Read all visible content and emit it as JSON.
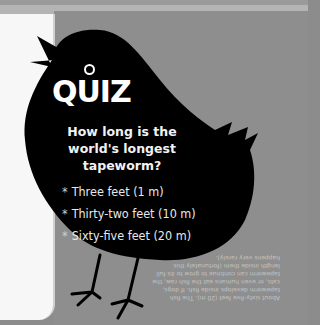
{
  "quiz": {
    "title": "QUIZ",
    "question": "How long is the world's longest tapeworm?",
    "options": [
      "Three feet (1 m)",
      "Thirty-two feet (10 m)",
      "Sixty-five feet (20 m)"
    ],
    "bullet_glyph": "*",
    "answer_upside_down": "About sixty-five feet (20 m). The fish tapeworm develops inside fish. If dogs, cats, or even humans eat the fish raw, the tapeworm can continue to grow to its full length inside them (fortunately this happens very rarely)."
  },
  "colors": {
    "background": "#8e8e8e",
    "bird": "#000000",
    "left_page": "#f7f7f7",
    "text": "#ffffff"
  }
}
